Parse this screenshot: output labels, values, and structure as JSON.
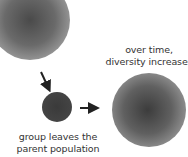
{
  "diagram": {
    "nodes": [
      {
        "id": "parent-population",
        "shape": "large circle, gray gradient",
        "label": ""
      },
      {
        "id": "founder-group",
        "shape": "small dark circle",
        "label": "group leaves the parent population"
      },
      {
        "id": "new-population",
        "shape": "large circle, gray gradient",
        "label": "over time, diversity increases"
      }
    ],
    "edges": [
      {
        "from": "parent-population",
        "to": "founder-group",
        "style": "arrow"
      },
      {
        "from": "founder-group",
        "to": "new-population",
        "style": "arrow"
      }
    ]
  },
  "labels": {
    "time_line1": "over time,",
    "time_line2": "diversity increases",
    "group_line1": "group leaves the",
    "group_line2": "parent population"
  },
  "colors": {
    "arrow": "#222222",
    "text": "#333333"
  }
}
